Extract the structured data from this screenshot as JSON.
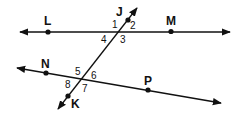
{
  "diagram": {
    "type": "geometry-parallel-lines-transversal",
    "colors": {
      "stroke": "#111111",
      "background": "#ffffff"
    },
    "lines": [
      {
        "name": "LM",
        "points": [
          "L",
          "M"
        ]
      },
      {
        "name": "NP",
        "points": [
          "N",
          "P"
        ]
      },
      {
        "name": "JK",
        "points": [
          "J",
          "K"
        ]
      }
    ],
    "points": {
      "L": "L",
      "M": "M",
      "N": "N",
      "P": "P",
      "J": "J",
      "K": "K"
    },
    "angles": {
      "a1": "1",
      "a2": "2",
      "a3": "3",
      "a4": "4",
      "a5": "5",
      "a6": "6",
      "a7": "7",
      "a8": "8"
    }
  }
}
